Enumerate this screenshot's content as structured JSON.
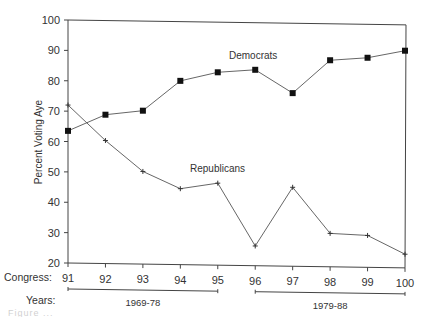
{
  "chart_data": {
    "type": "line",
    "title": "",
    "xlabel": "Congress:",
    "ylabel": "Percent Voting Aye",
    "ylim": [
      20,
      100
    ],
    "yticks": [
      20,
      30,
      40,
      50,
      60,
      70,
      80,
      90,
      100
    ],
    "x": [
      91,
      92,
      93,
      94,
      95,
      96,
      97,
      98,
      99,
      100
    ],
    "x_tick_labels": [
      "91",
      "92",
      "93",
      "94",
      "95",
      "96",
      "97",
      "98",
      "99",
      "100"
    ],
    "grid": false,
    "series": [
      {
        "name": "Democrats",
        "marker": "square",
        "values": [
          63.5,
          69,
          70.5,
          80.5,
          83.5,
          84.5,
          77,
          88,
          89,
          91.5
        ]
      },
      {
        "name": "Republicans",
        "marker": "plus",
        "values": [
          72,
          60.5,
          50.5,
          45,
          47,
          26.5,
          46,
          31,
          30.5,
          24.5
        ]
      }
    ],
    "annotations": {
      "series_labels": [
        {
          "series": "Democrats",
          "text": "Democrats"
        },
        {
          "series": "Republicans",
          "text": "Republicans"
        }
      ]
    },
    "secondary_axis": {
      "label": "Years:",
      "ranges": [
        {
          "label": "1969-78",
          "from_congress": 91,
          "to_congress": 95
        },
        {
          "label": "1979-88",
          "from_congress": 96,
          "to_congress": 100
        }
      ]
    }
  },
  "caption": {
    "text": "Figure ..."
  }
}
